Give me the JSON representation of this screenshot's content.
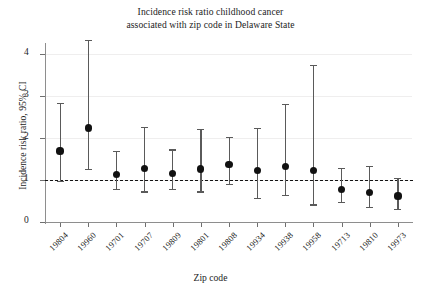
{
  "chart_data": {
    "type": "scatter",
    "title": "Incidence risk ratio childhood cancer associated with zip code in Delaware State",
    "title_lines": [
      "Incidence risk ratio childhood cancer",
      "associated with zip code in Delaware State"
    ],
    "xlabel": "Zip code",
    "ylabel": "Incidence risk ratio, 95% CI",
    "ylim": [
      0,
      4.55
    ],
    "yticks": [
      0,
      1,
      2,
      3,
      4
    ],
    "ytick_labels": [
      "0",
      "1",
      "2",
      "3",
      "4"
    ],
    "grid": true,
    "legend": null,
    "reference_line": {
      "value": 1,
      "style": "dashed",
      "color": "#141414"
    },
    "marker_color": "#111111",
    "errorbar_color": "#5a5a5a",
    "categories": [
      "19804",
      "19960",
      "19701",
      "19707",
      "19809",
      "19801",
      "19808",
      "19934",
      "19938",
      "19958",
      "19713",
      "19810",
      "19973"
    ],
    "estimates": [
      1.69,
      2.24,
      1.13,
      1.27,
      1.15,
      1.26,
      1.36,
      1.23,
      1.33,
      1.22,
      0.77,
      0.7,
      0.62
    ],
    "ci_lower": [
      0.98,
      1.26,
      0.78,
      0.73,
      0.78,
      0.73,
      0.9,
      0.58,
      0.65,
      0.42,
      0.47,
      0.36,
      0.31
    ],
    "ci_upper": [
      2.83,
      4.33,
      1.69,
      2.27,
      1.73,
      2.22,
      2.02,
      2.25,
      2.82,
      3.75,
      1.29,
      1.33,
      1.05
    ],
    "points": [
      {
        "zip": "19804",
        "estimate": 1.69,
        "lower": 0.98,
        "upper": 2.83
      },
      {
        "zip": "19960",
        "estimate": 2.24,
        "lower": 1.26,
        "upper": 4.33
      },
      {
        "zip": "19701",
        "estimate": 1.13,
        "lower": 0.78,
        "upper": 1.69
      },
      {
        "zip": "19707",
        "estimate": 1.27,
        "lower": 0.73,
        "upper": 2.27
      },
      {
        "zip": "19809",
        "estimate": 1.15,
        "lower": 0.78,
        "upper": 1.73
      },
      {
        "zip": "19801",
        "estimate": 1.26,
        "lower": 0.73,
        "upper": 2.22
      },
      {
        "zip": "19808",
        "estimate": 1.36,
        "lower": 0.9,
        "upper": 2.02
      },
      {
        "zip": "19934",
        "estimate": 1.23,
        "lower": 0.58,
        "upper": 2.25
      },
      {
        "zip": "19938",
        "estimate": 1.33,
        "lower": 0.65,
        "upper": 2.82
      },
      {
        "zip": "19958",
        "estimate": 1.22,
        "lower": 0.42,
        "upper": 3.75
      },
      {
        "zip": "19713",
        "estimate": 0.77,
        "lower": 0.47,
        "upper": 1.29
      },
      {
        "zip": "19810",
        "estimate": 0.7,
        "lower": 0.36,
        "upper": 1.33
      },
      {
        "zip": "19973",
        "estimate": 0.62,
        "lower": 0.31,
        "upper": 1.05
      }
    ]
  }
}
